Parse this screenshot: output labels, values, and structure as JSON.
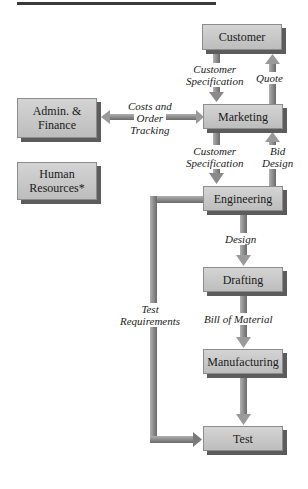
{
  "diagram": {
    "type": "organizational-flowchart",
    "nodes": [
      {
        "id": "customer",
        "label": "Customer"
      },
      {
        "id": "marketing",
        "label": "Marketing"
      },
      {
        "id": "admin",
        "label": "Admin. & Finance"
      },
      {
        "id": "hr",
        "label": "Human Resources*"
      },
      {
        "id": "engineering",
        "label": "Engineering"
      },
      {
        "id": "drafting",
        "label": "Drafting"
      },
      {
        "id": "manufacturing",
        "label": "Manufacturing"
      },
      {
        "id": "test",
        "label": "Test"
      }
    ],
    "edges": [
      {
        "from": "customer",
        "to": "marketing",
        "label": "Customer Specification"
      },
      {
        "from": "marketing",
        "to": "customer",
        "label": "Quote"
      },
      {
        "from": "admin",
        "to": "marketing",
        "label": "Costs and Order Tracking",
        "bidirectional": true
      },
      {
        "from": "marketing",
        "to": "engineering",
        "label": "Customer Specification"
      },
      {
        "from": "engineering",
        "to": "marketing",
        "label": "Bid Design"
      },
      {
        "from": "engineering",
        "to": "drafting",
        "label": "Design"
      },
      {
        "from": "drafting",
        "to": "manufacturing",
        "label": "Bill of Material"
      },
      {
        "from": "manufacturing",
        "to": "test",
        "label": ""
      },
      {
        "from": "engineering",
        "to": "test",
        "label": "Test Requirements"
      }
    ]
  },
  "boxes": {
    "customer": "Customer",
    "marketing": "Marketing",
    "admin_l1": "Admin. &",
    "admin_l2": "Finance",
    "hr_l1": "Human",
    "hr_l2": "Resources*",
    "engineering": "Engineering",
    "drafting": "Drafting",
    "manufacturing": "Manufacturing",
    "test": "Test"
  },
  "labels": {
    "cust_spec1_l1": "Customer",
    "cust_spec1_l2": "Specification",
    "quote": "Quote",
    "costs_l1": "Costs and",
    "costs_l2": "Order",
    "costs_l3": "Tracking",
    "cust_spec2_l1": "Customer",
    "cust_spec2_l2": "Specification",
    "bid_l1": "Bid",
    "bid_l2": "Design",
    "design": "Design",
    "bom": "Bill of Material",
    "testreq_l1": "Test",
    "testreq_l2": "Requirements"
  },
  "colors": {
    "box_fill": "#c9c9c9",
    "box_shadow": "#5c5c5c",
    "arrow": "#8a8a8a"
  }
}
